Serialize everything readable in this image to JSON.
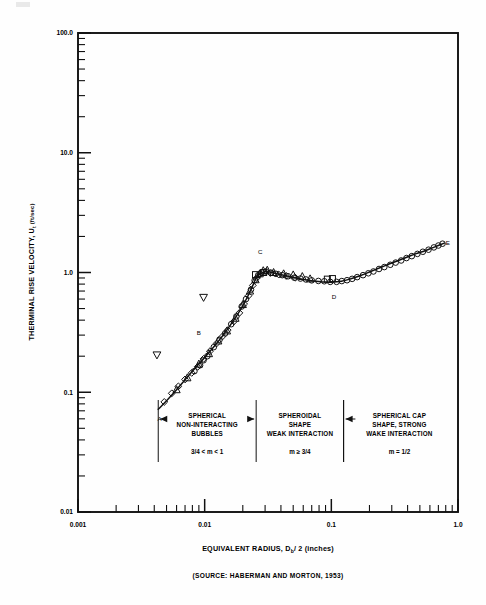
{
  "figure": {
    "y_axis_title_main": "THERMINAL RISE VELOCITY, U",
    "y_axis_title_sub": "t",
    "y_axis_title_unit": "(ft/sec)",
    "x_axis_title_a": "EQUIVALENT RADIUS, D",
    "x_axis_title_sub": "b",
    "x_axis_title_b": "/ 2 (inches)",
    "source": "(SOURCE:  HABERMAN AND MORTON, 1953)"
  },
  "chart_data": {
    "type": "scatter",
    "title": "",
    "xlabel": "EQUIVALENT RADIUS, Db/2 (inches)",
    "ylabel": "THERMINAL RISE VELOCITY, Ut (ft/sec)",
    "xscale": "log",
    "yscale": "log",
    "xlim": [
      0.001,
      1.0
    ],
    "ylim": [
      0.01,
      100.0
    ],
    "grid": false,
    "legend": "none",
    "x_tick_labels": [
      "0.001",
      "0.01",
      "0.1",
      "1.0"
    ],
    "x_tick_values": [
      0.001,
      0.01,
      0.1,
      1.0
    ],
    "y_tick_labels": [
      "0.01",
      "0.1",
      "1.0",
      "10.0",
      "100.0"
    ],
    "y_tick_values": [
      0.01,
      0.1,
      1.0,
      10.0,
      100.0
    ],
    "curve": {
      "name": "terminal rise velocity",
      "x": [
        0.0043,
        0.005,
        0.006,
        0.007,
        0.008,
        0.009,
        0.01,
        0.012,
        0.014,
        0.016,
        0.018,
        0.02,
        0.022,
        0.024,
        0.026,
        0.03,
        0.034,
        0.04,
        0.047,
        0.055,
        0.065,
        0.075,
        0.085,
        0.1,
        0.12,
        0.14,
        0.17,
        0.2,
        0.25,
        0.3,
        0.38,
        0.46,
        0.55,
        0.65,
        0.78
      ],
      "y": [
        0.072,
        0.085,
        0.105,
        0.127,
        0.15,
        0.172,
        0.195,
        0.245,
        0.3,
        0.365,
        0.44,
        0.53,
        0.64,
        0.78,
        0.93,
        1.02,
        1.0,
        0.96,
        0.925,
        0.89,
        0.865,
        0.845,
        0.835,
        0.83,
        0.845,
        0.88,
        0.945,
        1.01,
        1.11,
        1.2,
        1.32,
        1.43,
        1.52,
        1.63,
        1.76
      ]
    },
    "series": [
      {
        "name": "circle-markers",
        "marker": "circle",
        "points": [
          [
            0.0083,
            0.15
          ],
          [
            0.0092,
            0.168
          ],
          [
            0.0098,
            0.185
          ],
          [
            0.0105,
            0.2
          ],
          [
            0.0118,
            0.238
          ],
          [
            0.0131,
            0.275
          ],
          [
            0.0145,
            0.31
          ],
          [
            0.0162,
            0.37
          ],
          [
            0.0178,
            0.43
          ],
          [
            0.0196,
            0.52
          ],
          [
            0.0212,
            0.6
          ],
          [
            0.0232,
            0.72
          ],
          [
            0.0248,
            0.86
          ],
          [
            0.0265,
            0.95
          ],
          [
            0.0281,
            1.0
          ],
          [
            0.0305,
            1.02
          ],
          [
            0.0335,
            0.995
          ],
          [
            0.0365,
            0.975
          ],
          [
            0.041,
            0.95
          ],
          [
            0.0455,
            0.93
          ],
          [
            0.051,
            0.905
          ],
          [
            0.057,
            0.89
          ],
          [
            0.063,
            0.875
          ],
          [
            0.07,
            0.86
          ],
          [
            0.079,
            0.85
          ],
          [
            0.088,
            0.845
          ],
          [
            0.098,
            0.835
          ],
          [
            0.11,
            0.835
          ],
          [
            0.121,
            0.848
          ],
          [
            0.133,
            0.862
          ],
          [
            0.146,
            0.885
          ],
          [
            0.16,
            0.915
          ],
          [
            0.178,
            0.95
          ],
          [
            0.196,
            0.985
          ],
          [
            0.215,
            1.02
          ],
          [
            0.238,
            1.07
          ],
          [
            0.262,
            1.11
          ],
          [
            0.292,
            1.16
          ],
          [
            0.322,
            1.21
          ],
          [
            0.356,
            1.26
          ],
          [
            0.392,
            1.32
          ],
          [
            0.432,
            1.37
          ],
          [
            0.478,
            1.43
          ],
          [
            0.528,
            1.49
          ],
          [
            0.585,
            1.55
          ],
          [
            0.645,
            1.62
          ],
          [
            0.7,
            1.68
          ],
          [
            0.755,
            1.74
          ]
        ]
      },
      {
        "name": "diamond-markers",
        "marker": "diamond",
        "points": [
          [
            0.0048,
            0.083
          ],
          [
            0.0055,
            0.098
          ],
          [
            0.0062,
            0.112
          ],
          [
            0.007,
            0.128
          ],
          [
            0.0079,
            0.145
          ],
          [
            0.0088,
            0.163
          ],
          [
            0.0098,
            0.19
          ],
          [
            0.011,
            0.22
          ],
          [
            0.0124,
            0.255
          ],
          [
            0.0138,
            0.292
          ],
          [
            0.0152,
            0.33
          ],
          [
            0.017,
            0.39
          ],
          [
            0.0188,
            0.46
          ],
          [
            0.0205,
            0.545
          ],
          [
            0.0222,
            0.64
          ],
          [
            0.024,
            0.78
          ],
          [
            0.0258,
            0.9
          ],
          [
            0.0275,
            0.975
          ],
          [
            0.033,
            0.99
          ],
          [
            0.0385,
            0.96
          ],
          [
            0.044,
            0.935
          ],
          [
            0.052,
            0.905
          ]
        ]
      },
      {
        "name": "triangle-up-markers",
        "marker": "triangle-up",
        "points": [
          [
            0.006,
            0.105
          ],
          [
            0.0073,
            0.132
          ],
          [
            0.009,
            0.172
          ],
          [
            0.0108,
            0.21
          ],
          [
            0.0128,
            0.268
          ],
          [
            0.015,
            0.325
          ],
          [
            0.0175,
            0.415
          ],
          [
            0.02,
            0.54
          ],
          [
            0.0228,
            0.7
          ],
          [
            0.0252,
            0.87
          ],
          [
            0.0272,
            0.975
          ],
          [
            0.029,
            1.035
          ],
          [
            0.0312,
            1.045
          ],
          [
            0.035,
            1.0
          ],
          [
            0.042,
            0.975
          ],
          [
            0.05,
            0.955
          ],
          [
            0.059,
            0.925
          ],
          [
            0.068,
            0.885
          ]
        ]
      },
      {
        "name": "square-markers",
        "marker": "square",
        "points": [
          [
            0.0252,
            0.96
          ],
          [
            0.0292,
            1.0
          ],
          [
            0.093,
            0.88
          ],
          [
            0.102,
            0.89
          ]
        ]
      },
      {
        "name": "triangle-down-outliers",
        "marker": "triangle-down",
        "points": [
          [
            0.0042,
            0.205
          ],
          [
            0.0098,
            0.62
          ]
        ]
      }
    ],
    "point_labels": [
      {
        "label": "A",
        "x": 0.0044,
        "y": 0.058
      },
      {
        "label": "B",
        "x": 0.009,
        "y": 0.3
      },
      {
        "label": "C",
        "x": 0.0275,
        "y": 1.42
      },
      {
        "label": "D",
        "x": 0.105,
        "y": 0.6
      },
      {
        "label": "E",
        "x": 0.83,
        "y": 1.7
      }
    ],
    "regions": [
      {
        "id": "region-1",
        "x_start": 0.0043,
        "x_end": 0.0255,
        "lines": [
          "SPHERICAL",
          "NON-INTERACTING",
          "BUBBLES"
        ],
        "m_value": "3/4 < m < 1"
      },
      {
        "id": "region-2",
        "x_start": 0.0255,
        "x_end": 0.125,
        "lines": [
          "SPHEROIDAL",
          "SHAPE",
          "WEAK INTERACTION"
        ],
        "m_value": "m ≥ 3/4"
      },
      {
        "id": "region-3",
        "x_start": 0.125,
        "x_end": 0.95,
        "lines": [
          "SPHERICAL CAP",
          "SHAPE, STRONG",
          "WAKE INTERACTION"
        ],
        "m_value": "m = 1/2"
      }
    ]
  }
}
